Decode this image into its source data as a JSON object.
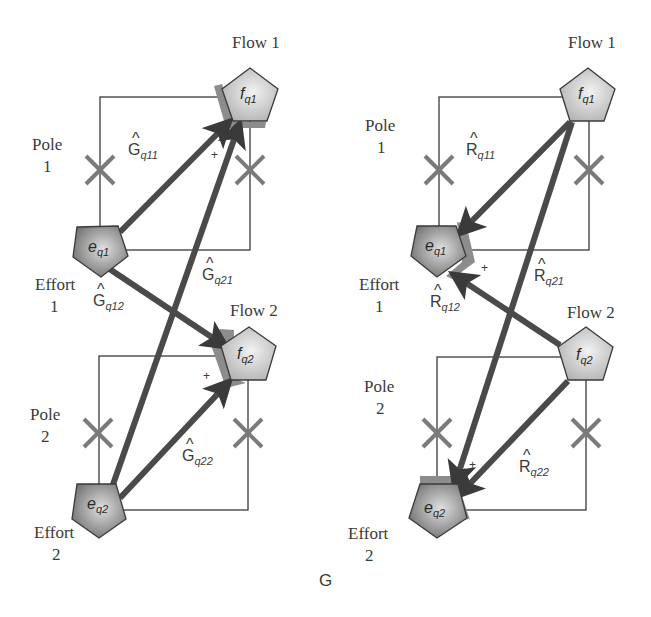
{
  "diagram": {
    "caption": "G",
    "left_panel": {
      "labels": {
        "flow1": "Flow 1",
        "flow2": "Flow 2",
        "pole1_line1": "Pole",
        "pole1_line2": "1",
        "pole2_line1": "Pole",
        "pole2_line2": "2",
        "effort1_line1": "Effort",
        "effort1_line2": "1",
        "effort2_line1": "Effort",
        "effort2_line2": "2"
      },
      "nodes": {
        "f1": {
          "base": "f",
          "sub": "q1"
        },
        "f2": {
          "base": "f",
          "sub": "q2"
        },
        "e1": {
          "base": "e",
          "sub": "q1"
        },
        "e2": {
          "base": "e",
          "sub": "q2"
        }
      },
      "gains": {
        "g11": {
          "hat": "^",
          "base": "G",
          "sub": "q11"
        },
        "g21": {
          "hat": "^",
          "base": "G",
          "sub": "q21"
        },
        "g12": {
          "hat": "^",
          "base": "G",
          "sub": "q12"
        },
        "g22": {
          "hat": "^",
          "base": "G",
          "sub": "q22"
        }
      },
      "plus_sign": "+",
      "edges": [
        {
          "from": "e_q1",
          "to": "f_q1",
          "gain": "Ĝq11"
        },
        {
          "from": "e_q2",
          "to": "f_q1",
          "gain": "Ĝq21"
        },
        {
          "from": "e_q1",
          "to": "f_q2",
          "gain": "Ĝq12"
        },
        {
          "from": "e_q2",
          "to": "f_q2",
          "gain": "Ĝq22"
        }
      ]
    },
    "right_panel": {
      "labels": {
        "flow1": "Flow 1",
        "flow2": "Flow 2",
        "pole1_line1": "Pole",
        "pole1_line2": "1",
        "pole2_line1": "Pole",
        "pole2_line2": "2",
        "effort1_line1": "Effort",
        "effort1_line2": "1",
        "effort2_line1": "Effort",
        "effort2_line2": "2"
      },
      "nodes": {
        "f1": {
          "base": "f",
          "sub": "q1"
        },
        "f2": {
          "base": "f",
          "sub": "q2"
        },
        "e1": {
          "base": "e",
          "sub": "q1"
        },
        "e2": {
          "base": "e",
          "sub": "q2"
        }
      },
      "gains": {
        "r11": {
          "hat": "^",
          "base": "R",
          "sub": "q11"
        },
        "r21": {
          "hat": "^",
          "base": "R",
          "sub": "q21"
        },
        "r12": {
          "hat": "^",
          "base": "R",
          "sub": "q12"
        },
        "r22": {
          "hat": "^",
          "base": "R",
          "sub": "q22"
        }
      },
      "plus_sign": "+",
      "edges": [
        {
          "from": "f_q1",
          "to": "e_q1",
          "gain": "R̂q11"
        },
        {
          "from": "f_q1",
          "to": "e_q2",
          "gain": "R̂q21"
        },
        {
          "from": "f_q2",
          "to": "e_q1",
          "gain": "R̂q12"
        },
        {
          "from": "f_q2",
          "to": "e_q2",
          "gain": "R̂q22"
        }
      ]
    },
    "colors": {
      "arrow": "#4a4a4a",
      "xmark": "#7a7a7a",
      "flow_node": "#c8c8c8",
      "effort_node": "#8a8a8a",
      "summing_shadow": "#8c8c8c",
      "line": "#3a3a3a"
    }
  }
}
